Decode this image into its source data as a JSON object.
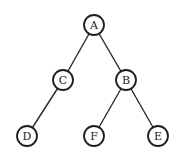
{
  "diagram": {
    "type": "binary-tree",
    "nodes": [
      {
        "id": "A",
        "label": "A",
        "x": 94,
        "y": 25
      },
      {
        "id": "C",
        "label": "C",
        "x": 63,
        "y": 80
      },
      {
        "id": "B",
        "label": "B",
        "x": 126,
        "y": 80
      },
      {
        "id": "D",
        "label": "D",
        "x": 27,
        "y": 136
      },
      {
        "id": "F",
        "label": "F",
        "x": 94,
        "y": 136
      },
      {
        "id": "E",
        "label": "E",
        "x": 158,
        "y": 136
      }
    ],
    "edges": [
      {
        "from": "A",
        "to": "C"
      },
      {
        "from": "A",
        "to": "B"
      },
      {
        "from": "C",
        "to": "D"
      },
      {
        "from": "B",
        "to": "F"
      },
      {
        "from": "B",
        "to": "E"
      }
    ],
    "node_radius": 10,
    "colors": {
      "stroke": "#1e1e1e",
      "fill": "#ffffff",
      "text": "#222222",
      "background": "#ffffff"
    }
  }
}
